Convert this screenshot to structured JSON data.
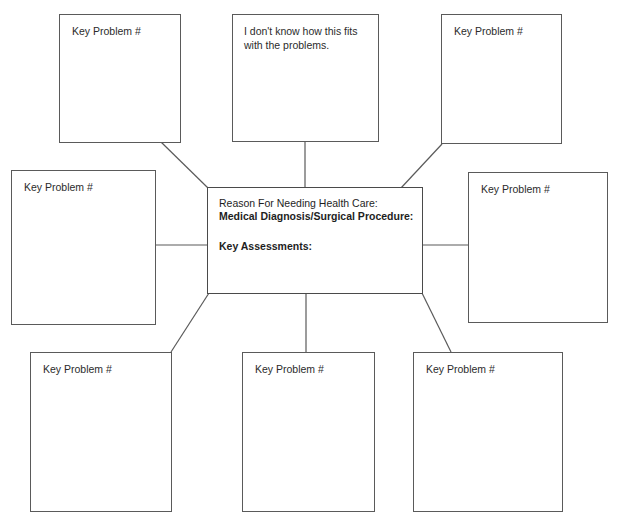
{
  "diagram": {
    "background_color": "#ffffff",
    "box_border_color": "#5a5a5a",
    "connector_color": "#5a5a5a",
    "center": {
      "lines": [
        "Reason For Needing Health Care:",
        "Medical Diagnosis/Surgical Procedure:",
        "Key Assessments:"
      ],
      "line0": "Reason For Needing Health Care:",
      "line1": "Medical Diagnosis/Surgical Procedure:",
      "line2": "Key Assessments:"
    },
    "nodes": [
      {
        "id": "top-left",
        "label": "Key Problem #"
      },
      {
        "id": "top-middle",
        "label": "I don't know how this fits with the problems."
      },
      {
        "id": "top-right",
        "label": "Key Problem #"
      },
      {
        "id": "middle-left",
        "label": "Key Problem #"
      },
      {
        "id": "middle-right",
        "label": "Key Problem #"
      },
      {
        "id": "bottom-left",
        "label": "Key Problem #"
      },
      {
        "id": "bottom-middle",
        "label": "Key Problem #"
      },
      {
        "id": "bottom-right",
        "label": "Key Problem #"
      }
    ],
    "footer_note": ""
  }
}
